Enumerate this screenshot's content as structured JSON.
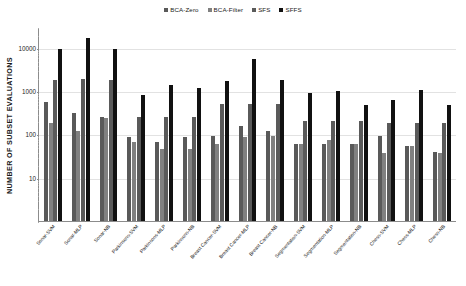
{
  "chart_data": {
    "type": "bar",
    "title": "",
    "xlabel": "",
    "ylabel": "NUMBER OF SUBSET EVALUATIONS",
    "yscale": "log",
    "ylim": [
      1,
      30000
    ],
    "ytick_labels": [
      "10",
      "100",
      "1000",
      "10000"
    ],
    "ytick_values": [
      10,
      100,
      1000,
      10000
    ],
    "grid": true,
    "legend_position": "top-center",
    "categories": [
      "Sonar-SVM",
      "Sonar-MLP",
      "Sonar-NB",
      "Parkinsons-SVM",
      "Parkinsons-MLP",
      "Parkinsons-NB",
      "Breast Cancer-SVM",
      "Breast Cancer-MLP",
      "Breast Cancer-NB",
      "Segmentation-SVM",
      "Segmentation-MLP",
      "Segmentation-NB",
      "Chess-SVM",
      "Chess-MLP",
      "Chess-NB"
    ],
    "series": [
      {
        "name": "BCA-Zero",
        "color": "#595959",
        "values": [
          550,
          310,
          245,
          88,
          67,
          88,
          90,
          155,
          120,
          59,
          59,
          59,
          92,
          55,
          39
        ]
      },
      {
        "name": "BCA-Filter",
        "color": "#808080",
        "values": [
          180,
          120,
          240,
          65,
          45,
          46,
          61,
          88,
          90,
          59,
          74,
          59,
          38,
          54,
          38
        ]
      },
      {
        "name": "SFS",
        "color": "#5a5a5a",
        "values": [
          1800,
          1850,
          1820,
          255,
          255,
          255,
          490,
          490,
          490,
          200,
          200,
          200,
          180,
          180,
          185
        ]
      },
      {
        "name": "SFFS",
        "color": "#111111",
        "values": [
          9400,
          16500,
          9200,
          800,
          1400,
          1150,
          1700,
          5400,
          1800,
          900,
          1020,
          480,
          630,
          1060,
          470
        ]
      }
    ]
  },
  "legend": {
    "items": [
      {
        "label": "BCA-Zero",
        "color": "#595959"
      },
      {
        "label": "BCA-Filter",
        "color": "#808080"
      },
      {
        "label": "SFS",
        "color": "#5a5a5a"
      },
      {
        "label": "SFFS",
        "color": "#111111"
      }
    ]
  }
}
